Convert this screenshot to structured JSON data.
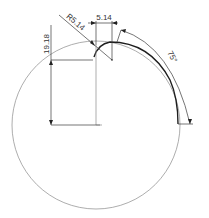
{
  "drawing": {
    "dimensions": {
      "vertical": {
        "label": "19.18"
      },
      "horizontal": {
        "label": "5.14"
      },
      "radius": {
        "label": "R5.14"
      },
      "angle": {
        "label": "75°"
      }
    },
    "colors": {
      "outline": "#8a8a8a",
      "profile": "#1e1e1e",
      "dimension": "#3a3a3a",
      "text": "#333333"
    }
  }
}
